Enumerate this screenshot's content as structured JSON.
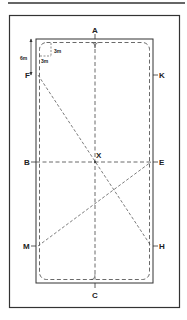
{
  "diagram": {
    "type": "dressage-arena",
    "markers": {
      "A": "A",
      "C": "C",
      "F": "F",
      "K": "K",
      "B": "B",
      "E": "E",
      "M": "M",
      "H": "H",
      "X": "X"
    },
    "dimensions": {
      "corner_offset": "6m",
      "corner_radius_h": "3m",
      "corner_radius_v": "3m"
    },
    "colors": {
      "line": "#222222",
      "background": "#ffffff"
    }
  }
}
